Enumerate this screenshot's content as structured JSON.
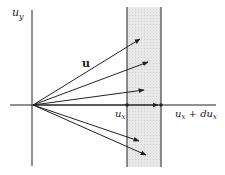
{
  "diagram": {
    "labels": {
      "y_axis": "u",
      "y_axis_sub": "y",
      "vector": "u",
      "x_left": "u",
      "x_left_sub": "x",
      "x_right": "u",
      "x_right_sub": "x",
      "x_right_plus": " + du",
      "x_right_plus_sub": "x"
    },
    "colors": {
      "strip_fill": "#e6e6e6",
      "lines": "#222222"
    },
    "origin": [
      33,
      105
    ],
    "strip": {
      "x1": 127,
      "x2": 161,
      "y_top": 7,
      "y_bottom": 167
    },
    "arrows": [
      {
        "tip": [
          140,
          39
        ]
      },
      {
        "tip": [
          148,
          62
        ]
      },
      {
        "tip": [
          144,
          90
        ]
      },
      {
        "tip": [
          160,
          105
        ]
      },
      {
        "tip": [
          139,
          141
        ]
      },
      {
        "tip": [
          146,
          155
        ]
      }
    ]
  }
}
